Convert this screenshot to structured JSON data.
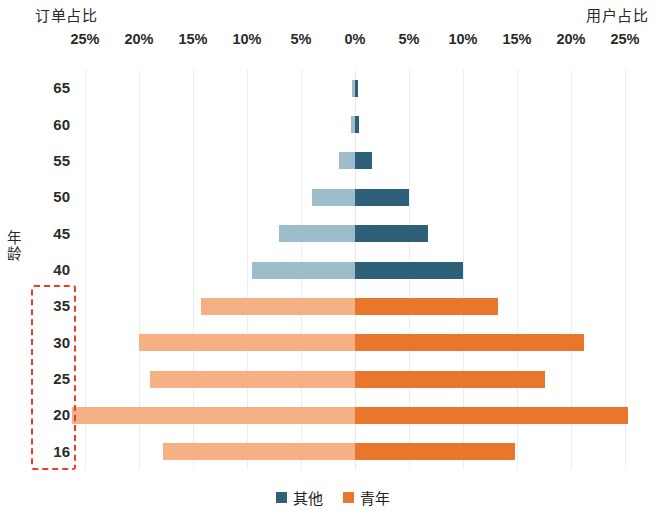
{
  "captions": {
    "left": "订单占比",
    "right": "用户占比"
  },
  "axis": {
    "y_title": "年龄",
    "x_ticks": [
      "25%",
      "20%",
      "15%",
      "10%",
      "5%",
      "0%",
      "5%",
      "10%",
      "15%",
      "20%",
      "25%"
    ]
  },
  "legend": {
    "items": [
      {
        "label": "其他",
        "color": "#2e6179"
      },
      {
        "label": "青年",
        "color": "#e8762c"
      }
    ]
  },
  "colors": {
    "other_left": "#9dbdcb",
    "other_right": "#2e6179",
    "youth_left": "#f5b183",
    "youth_right": "#e8762c",
    "highlight": "#ef3b2c",
    "gridline": "#e9eef2"
  },
  "highlight": {
    "note": "red dashed box around age groups 35 through 16",
    "age_groups": [
      "35",
      "30",
      "25",
      "20",
      "16"
    ]
  },
  "chart_data": {
    "type": "bar",
    "subtype": "population-pyramid",
    "title": "",
    "xlabel_left": "订单占比",
    "xlabel_right": "用户占比",
    "ylabel": "年龄",
    "grid": true,
    "legend_position": "bottom-center",
    "xlim": [
      25,
      25
    ],
    "x_ticks": [
      25,
      20,
      15,
      10,
      5,
      0,
      5,
      10,
      15,
      20,
      25
    ],
    "categories": [
      "65",
      "60",
      "55",
      "50",
      "45",
      "40",
      "35",
      "30",
      "25",
      "20",
      "16"
    ],
    "series": [
      {
        "name": "订单占比",
        "side": "left",
        "values": [
          0.3,
          0.4,
          1.5,
          4.0,
          7.0,
          9.5,
          14.3,
          20.0,
          19.0,
          26.2,
          17.8
        ]
      },
      {
        "name": "用户占比",
        "side": "right",
        "values": [
          0.3,
          0.4,
          1.6,
          5.0,
          6.8,
          10.0,
          13.2,
          21.2,
          17.6,
          25.3,
          14.8
        ]
      }
    ],
    "group_of_category": [
      "其他",
      "其他",
      "其他",
      "其他",
      "其他",
      "其他",
      "青年",
      "青年",
      "青年",
      "青年",
      "青年"
    ]
  }
}
